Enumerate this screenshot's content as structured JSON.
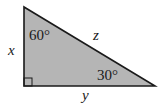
{
  "diagram": {
    "type": "right-triangle",
    "fill_color": "#b5b5b5",
    "stroke_color": "#1a1a1a",
    "vertices": {
      "top": [
        24,
        7
      ],
      "right_angle": [
        24,
        86
      ],
      "right": [
        155,
        86
      ]
    },
    "angles": {
      "top": "60°",
      "right": "30°",
      "bottom_left": "90°"
    },
    "sides": {
      "left": "x",
      "bottom": "y",
      "hypotenuse": "z"
    }
  }
}
